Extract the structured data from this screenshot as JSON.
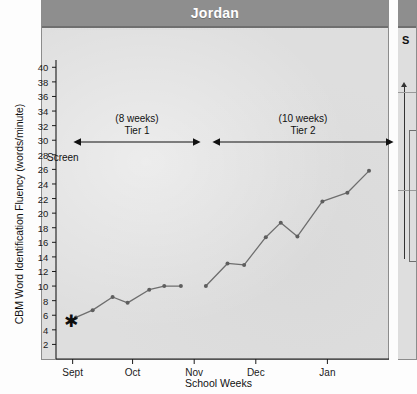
{
  "panel": {
    "title": "Jordan",
    "screen_label": "Screen",
    "star_marker": "✱"
  },
  "right_panel": {
    "partial_title_letter": "S"
  },
  "annotations": [
    {
      "id": "tier1",
      "line1": "(8 weeks)",
      "line2": "Tier 1"
    },
    {
      "id": "tier2",
      "line1": "(10 weeks)",
      "line2": "Tier 2"
    }
  ],
  "colors": {
    "header_gray": "#8e8e8e",
    "plot_gray": "#dedede",
    "line_gray": "#6e6e6e",
    "axis_black": "#1a1a1a",
    "title_white": "#ffffff"
  },
  "chart_data": {
    "type": "line",
    "title": "Jordan",
    "xlabel": "School Weeks",
    "ylabel": "CBM Word Identification Fluency (words/minute)",
    "ylim": [
      0,
      41
    ],
    "yticks": [
      2,
      4,
      6,
      8,
      10,
      12,
      14,
      16,
      18,
      20,
      22,
      24,
      26,
      28,
      30,
      32,
      34,
      36,
      38,
      40
    ],
    "xticks": [
      "Sept",
      "Oct",
      "Nov",
      "Dec",
      "Jan"
    ],
    "grid": false,
    "legend": "none",
    "series": [
      {
        "name": "Tier 1",
        "phase_label": "(8 weeks) Tier 1",
        "x": [
          1.2,
          2.2,
          3.4,
          4.3,
          5.6,
          6.5,
          7.5
        ],
        "values": [
          5.7,
          6.7,
          8.5,
          7.7,
          9.5,
          10.0,
          10.0
        ]
      },
      {
        "name": "Tier 2",
        "phase_label": "(10 weeks) Tier 2",
        "x": [
          9.0,
          10.3,
          11.3,
          12.6,
          13.5,
          14.5,
          16.0,
          17.5,
          18.8
        ],
        "values": [
          10.0,
          13.1,
          12.9,
          16.7,
          18.7,
          16.8,
          21.6,
          22.8,
          25.8
        ]
      }
    ],
    "markers": [
      {
        "name": "screen-star",
        "x": 1.2,
        "y": 5.7,
        "glyph": "*"
      }
    ],
    "phase_bars": [
      {
        "label": "Tier 1",
        "weeks": 8
      },
      {
        "label": "Tier 2",
        "weeks": 10
      }
    ]
  }
}
